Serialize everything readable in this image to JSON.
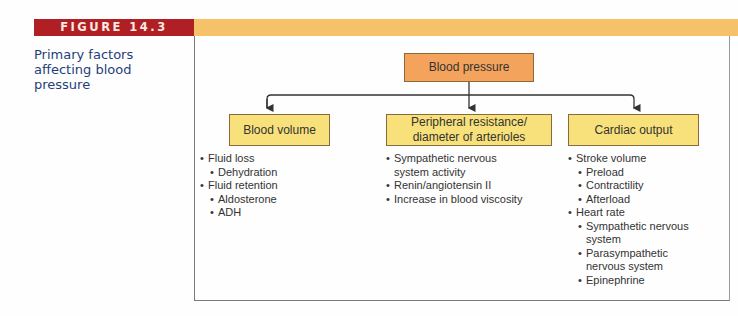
{
  "figure": {
    "label": "FIGURE 14.3",
    "caption": "Primary factors affecting blood pressure",
    "colors": {
      "label_bg": "#b01f24",
      "band": "#f5c26a",
      "root_box": "#f4a35c",
      "child_box": "#f8e17a",
      "caption": "#1f3f7a"
    }
  },
  "diagram": {
    "root": "Blood pressure",
    "children": [
      {
        "title": "Blood volume",
        "items": [
          {
            "text": "Fluid loss",
            "level": 1
          },
          {
            "text": "Dehydration",
            "level": 2
          },
          {
            "text": "Fluid retention",
            "level": 1
          },
          {
            "text": "Aldosterone",
            "level": 2
          },
          {
            "text": "ADH",
            "level": 2
          }
        ]
      },
      {
        "title_line1": "Peripheral resistance/",
        "title_line2": "diameter of arterioles",
        "items": [
          {
            "text": "Sympathetic nervous",
            "level": 1
          },
          {
            "text": "system activity",
            "level": 0
          },
          {
            "text": "Renin/angiotensin II",
            "level": 1
          },
          {
            "text": "Increase in blood viscosity",
            "level": 1
          }
        ]
      },
      {
        "title": "Cardiac output",
        "items": [
          {
            "text": "Stroke volume",
            "level": 1
          },
          {
            "text": "Preload",
            "level": 2
          },
          {
            "text": "Contractility",
            "level": 2
          },
          {
            "text": "Afterload",
            "level": 2
          },
          {
            "text": "Heart rate",
            "level": 1
          },
          {
            "text": "Sympathetic nervous",
            "level": 2
          },
          {
            "text": "system",
            "level": 3
          },
          {
            "text": "Parasympathetic",
            "level": 2
          },
          {
            "text": "nervous system",
            "level": 3
          },
          {
            "text": "Epinephrine",
            "level": 2
          }
        ]
      }
    ]
  }
}
